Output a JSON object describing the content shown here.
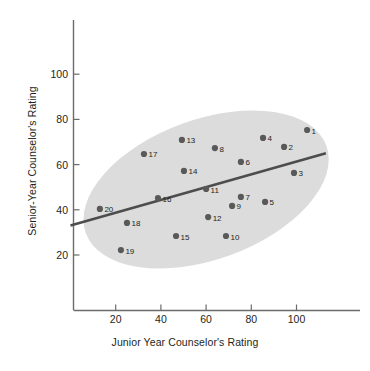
{
  "chart_data": {
    "type": "scatter",
    "title": "",
    "xlabel": "Junior Year Counselor's Rating",
    "ylabel": "Senior-Year Counselor's Rating",
    "xlim": [
      0,
      118
    ],
    "ylim": [
      0,
      118
    ],
    "xticks": [
      20,
      40,
      60,
      80,
      100
    ],
    "yticks": [
      20,
      40,
      60,
      80,
      100
    ],
    "grid": false,
    "legend": null,
    "annotations": {
      "ellipse": {
        "label": "data-envelope-ellipse",
        "center_x": 60,
        "center_y": 49,
        "rotation_deg": -20,
        "color": "#dcdcdc"
      },
      "trendline": {
        "label": "regression-line",
        "x_start": 0,
        "y_start": 33,
        "x_end": 113,
        "y_end": 65,
        "color": "#4d4d4d"
      }
    },
    "point_color": "#595959",
    "points": [
      {
        "label": "1",
        "x": 104.7,
        "y": 75.3
      },
      {
        "label": "2",
        "x": 94.5,
        "y": 67.8
      },
      {
        "label": "3",
        "x": 98.9,
        "y": 56.3
      },
      {
        "label": "4",
        "x": 85.2,
        "y": 71.8
      },
      {
        "label": "5",
        "x": 86.1,
        "y": 43.5
      },
      {
        "label": "6",
        "x": 75.4,
        "y": 61.2
      },
      {
        "label": "7",
        "x": 75.4,
        "y": 45.7
      },
      {
        "label": "8",
        "x": 63.9,
        "y": 67.3
      },
      {
        "label": "9",
        "x": 71.5,
        "y": 41.7
      },
      {
        "label": "10",
        "x": 68.8,
        "y": 28.4
      },
      {
        "label": "11",
        "x": 60.0,
        "y": 49.2
      },
      {
        "label": "12",
        "x": 60.9,
        "y": 36.8
      },
      {
        "label": "13",
        "x": 49.3,
        "y": 70.9
      },
      {
        "label": "14",
        "x": 50.2,
        "y": 57.2
      },
      {
        "label": "15",
        "x": 46.7,
        "y": 28.4
      },
      {
        "label": "16",
        "x": 38.7,
        "y": 45.2
      },
      {
        "label": "17",
        "x": 32.5,
        "y": 64.7
      },
      {
        "label": "18",
        "x": 25.0,
        "y": 34.2
      },
      {
        "label": "19",
        "x": 22.3,
        "y": 22.2
      },
      {
        "label": "20",
        "x": 13.0,
        "y": 40.4
      }
    ]
  }
}
